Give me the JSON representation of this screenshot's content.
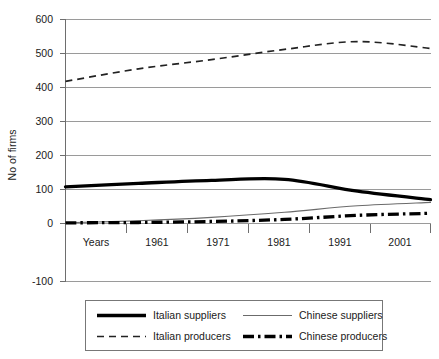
{
  "chart_data": {
    "type": "line",
    "title": "",
    "xlabel": "",
    "ylabel": "No of firms",
    "x": [
      1951,
      1961,
      1971,
      1981,
      1991,
      2001
    ],
    "x_tick_labels": [
      "Years",
      "1961",
      "1971",
      "1981",
      "1991",
      "2001"
    ],
    "y_tick_labels": [
      "-100",
      "0",
      "100",
      "200",
      "300",
      "400",
      "500",
      "600"
    ],
    "y_ticks": [
      -100,
      0,
      100,
      200,
      300,
      400,
      500,
      600
    ],
    "ylim": [
      -100,
      600
    ],
    "grid": true,
    "legend_position": "bottom",
    "series": [
      {
        "name": "Italian suppliers",
        "style": "thick-solid",
        "color": "#000000",
        "values": [
          108,
          118,
          127,
          130,
          95,
          70
        ]
      },
      {
        "name": "Chinese suppliers",
        "style": "thin-solid",
        "color": "#6b6b6b",
        "values": [
          2,
          8,
          18,
          33,
          52,
          62
        ]
      },
      {
        "name": "Italian producers",
        "style": "dashed",
        "color": "#222222",
        "values": [
          418,
          455,
          482,
          512,
          535,
          515
        ]
      },
      {
        "name": "Chinese producers",
        "style": "dash-dot-thick",
        "color": "#000000",
        "values": [
          2,
          3,
          6,
          12,
          24,
          30
        ]
      }
    ]
  },
  "axes": {
    "y_axis_title": "No of firms"
  },
  "legend": {
    "entries": [
      {
        "label": "Italian suppliers",
        "style": "thick-solid"
      },
      {
        "label": "Chinese suppliers",
        "style": "thin-solid"
      },
      {
        "label": "Italian producers",
        "style": "dashed"
      },
      {
        "label": "Chinese producers",
        "style": "dash-dot-thick"
      }
    ]
  }
}
